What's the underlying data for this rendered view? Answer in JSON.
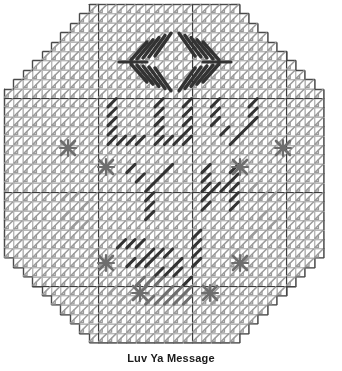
{
  "document": {
    "title": "Luv Ya Message",
    "type": "plastic-canvas-stitch-chart"
  },
  "caption": {
    "text": "Luv Ya Message"
  },
  "chart_data": {
    "type": "heatmap",
    "title": "Luv Ya Message",
    "subtitle": "",
    "xlabel": "",
    "ylabel": "",
    "grid": true,
    "legend_position": "none",
    "canvas": {
      "shape": "octagon",
      "cols": 34,
      "rows": 36,
      "cell_px": 9.4,
      "origin_x": 4,
      "origin_y": 4,
      "corner_step_cells": 2,
      "corner_steps": 5,
      "heavy_line_interval": 10
    },
    "colors": {
      "background": "#ffffff",
      "grid_light": "#b8b8b8",
      "grid_heavy": "#3a3a3a",
      "outline": "#4a4a4a",
      "stitch_light": "#9a9a9a",
      "stitch_mid": "#6e6e6e",
      "stitch_dark": "#333333",
      "caption_text": "#1a1a1a"
    },
    "categories": [
      "background-fill",
      "arrow-motif",
      "lettering",
      "star-motif"
    ],
    "values": [
      1108,
      2,
      3,
      8
    ],
    "series": [
      {
        "name": "background-fill",
        "description": "continental houndstooth stitch texture covering octagon interior",
        "color": "#9a9a9a",
        "count": 1108
      },
      {
        "name": "arrow-motif",
        "description": "paired chevron arrows pointing inward at top of chart",
        "color": "#333333",
        "count": 2
      },
      {
        "name": "lettering",
        "description": "diagonal slanted stitches spelling the message across center",
        "color": "#333333",
        "count": 3
      },
      {
        "name": "star-motif",
        "description": "X / snowflake cross-stitch accents placed symmetrically",
        "color": "#6e6e6e",
        "count": 8
      }
    ],
    "arrows": [
      {
        "name": "left-arrow",
        "cx": 145,
        "cy": 62,
        "direction": "left"
      },
      {
        "name": "right-arrow",
        "cx": 205,
        "cy": 62,
        "direction": "right"
      }
    ],
    "stars": [
      {
        "cx": 68,
        "cy": 148
      },
      {
        "cx": 283,
        "cy": 148
      },
      {
        "cx": 106,
        "cy": 167
      },
      {
        "cx": 240,
        "cy": 167
      },
      {
        "cx": 106,
        "cy": 263
      },
      {
        "cx": 240,
        "cy": 263
      },
      {
        "cx": 140,
        "cy": 293
      },
      {
        "cx": 210,
        "cy": 293
      }
    ],
    "letter_rows": [
      {
        "row": 1,
        "y": 95,
        "glyphs": [
          "L",
          "U",
          "V"
        ]
      },
      {
        "row": 2,
        "y": 160,
        "glyphs": [
          "Y",
          "A"
        ]
      },
      {
        "row": 3,
        "y": 225,
        "glyphs": [
          "message-strokes"
        ]
      }
    ],
    "ylim": [
      0,
      36
    ],
    "xlim": [
      0,
      34
    ]
  }
}
